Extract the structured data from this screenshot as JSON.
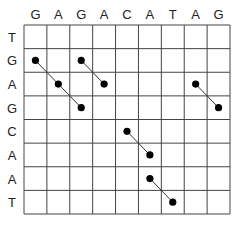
{
  "diagram": {
    "type": "dot-plot",
    "column_sequence": [
      "G",
      "A",
      "G",
      "A",
      "C",
      "A",
      "T",
      "A",
      "G"
    ],
    "row_sequence": [
      "T",
      "G",
      "A",
      "G",
      "C",
      "A",
      "A",
      "T"
    ],
    "matches": [
      {
        "row": 1,
        "col": 0
      },
      {
        "row": 2,
        "col": 1
      },
      {
        "row": 3,
        "col": 2
      },
      {
        "row": 1,
        "col": 2
      },
      {
        "row": 2,
        "col": 3
      },
      {
        "row": 2,
        "col": 7
      },
      {
        "row": 3,
        "col": 8
      },
      {
        "row": 4,
        "col": 4
      },
      {
        "row": 5,
        "col": 5
      },
      {
        "row": 6,
        "col": 5
      },
      {
        "row": 7,
        "col": 6
      }
    ],
    "diagonals": [
      [
        [
          1,
          0
        ],
        [
          2,
          1
        ],
        [
          3,
          2
        ]
      ],
      [
        [
          1,
          2
        ],
        [
          2,
          3
        ]
      ],
      [
        [
          2,
          7
        ],
        [
          3,
          8
        ]
      ],
      [
        [
          4,
          4
        ],
        [
          5,
          5
        ]
      ],
      [
        [
          6,
          5
        ],
        [
          7,
          6
        ]
      ]
    ],
    "colors": {
      "grid": "#444444",
      "dot": "#000000",
      "line": "#333333",
      "text": "#222222"
    }
  }
}
